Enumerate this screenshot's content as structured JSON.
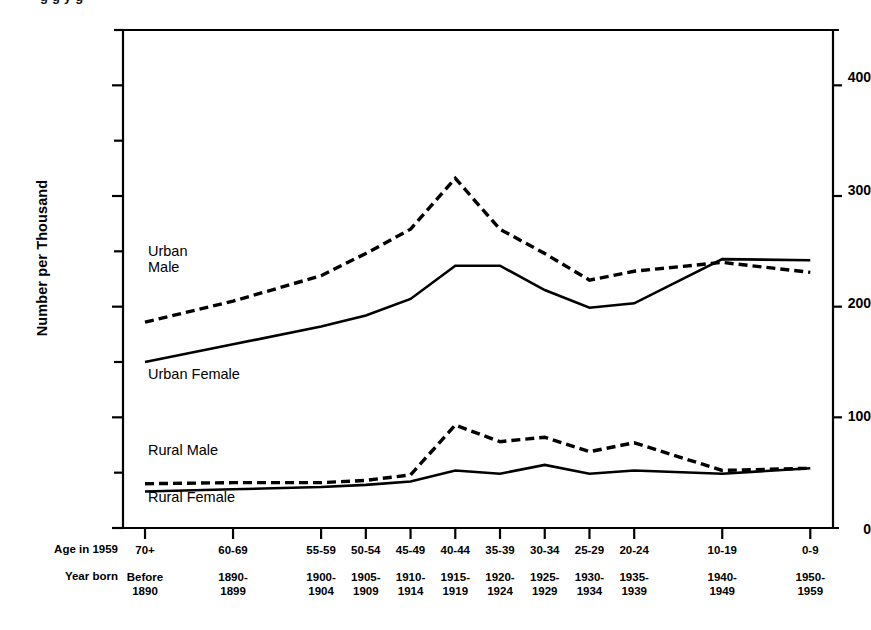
{
  "figure": {
    "clipped_title": "g g y g",
    "axis_color": "#000000",
    "plot": {
      "left": 123,
      "right": 833,
      "top": 30,
      "bottom": 528
    }
  },
  "yaxis": {
    "label": "Number per Thousand",
    "ticks": [
      "0",
      "100",
      "200",
      "300",
      "400"
    ],
    "minor_ticks": [
      50,
      150,
      250,
      350,
      450
    ],
    "min": 0,
    "max": 450
  },
  "xaxis": {
    "row_labels": {
      "age": "Age in 1959",
      "year": "Year born"
    },
    "categories": [
      {
        "age": "70+",
        "year": "Before\n1890"
      },
      {
        "age": "60-69",
        "year": "1890-\n1899"
      },
      {
        "age": "55-59",
        "year": "1900-\n1904"
      },
      {
        "age": "50-54",
        "year": "1905-\n1909"
      },
      {
        "age": "45-49",
        "year": "1910-\n1914"
      },
      {
        "age": "40-44",
        "year": "1915-\n1919"
      },
      {
        "age": "35-39",
        "year": "1920-\n1924"
      },
      {
        "age": "30-34",
        "year": "1925-\n1929"
      },
      {
        "age": "25-29",
        "year": "1930-\n1934"
      },
      {
        "age": "20-24",
        "year": "1935-\n1939"
      },
      {
        "age": "10-19",
        "year": "1940-\n1949"
      },
      {
        "age": "0-9",
        "year": "1950-\n1959"
      }
    ]
  },
  "annotations": [
    {
      "name": "urban-male-label",
      "text": "Urban\nMale",
      "x": 148,
      "y": 243
    },
    {
      "name": "urban-female-label",
      "text": "Urban Female",
      "x": 148,
      "y": 366
    },
    {
      "name": "rural-male-label",
      "text": "Rural Male",
      "x": 148,
      "y": 442
    },
    {
      "name": "rural-female-label",
      "text": "Rural Female",
      "x": 148,
      "y": 489
    }
  ],
  "chart_data": {
    "type": "line",
    "title": "",
    "xlabel": "Age in 1959 / Year born",
    "ylabel": "Number per Thousand",
    "ylim": [
      0,
      450
    ],
    "grid": false,
    "legend": "inline-annotations",
    "categories": [
      "70+",
      "60-69",
      "55-59",
      "50-54",
      "45-49",
      "40-44",
      "35-39",
      "30-34",
      "25-29",
      "20-24",
      "10-19",
      "0-9"
    ],
    "year_born": [
      "Before 1890",
      "1890-1899",
      "1900-1904",
      "1905-1909",
      "1910-1914",
      "1915-1919",
      "1920-1924",
      "1925-1929",
      "1930-1934",
      "1935-1939",
      "1940-1949",
      "1950-1959"
    ],
    "series": [
      {
        "name": "Urban Male",
        "style": "dashed",
        "values": [
          186,
          205,
          228,
          248,
          270,
          316,
          270,
          248,
          224,
          232,
          240,
          231
        ]
      },
      {
        "name": "Urban Female",
        "style": "solid",
        "values": [
          150,
          166,
          182,
          192,
          207,
          237,
          237,
          215,
          199,
          203,
          243,
          242
        ]
      },
      {
        "name": "Rural Male",
        "style": "dashed",
        "values": [
          40,
          41,
          41,
          43,
          48,
          93,
          78,
          82,
          69,
          77,
          52,
          54
        ]
      },
      {
        "name": "Rural Female",
        "style": "solid",
        "values": [
          33,
          35,
          37,
          39,
          42,
          52,
          49,
          57,
          49,
          52,
          49,
          54
        ]
      }
    ]
  }
}
